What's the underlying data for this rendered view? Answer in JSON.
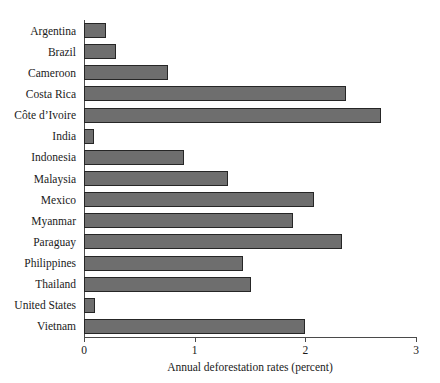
{
  "chart_data": {
    "type": "bar",
    "orientation": "horizontal",
    "title": "",
    "xlabel": "Annual deforestation rates (percent)",
    "ylabel": "",
    "xlim": [
      0,
      3
    ],
    "xticks": [
      "0",
      "1",
      "2",
      "3"
    ],
    "xtick_values": [
      0,
      1,
      2,
      3
    ],
    "grid": false,
    "legend": false,
    "bar_color": "#6e6e6e",
    "bar_border_color": "#262626",
    "axis_color": "#4a4a4a",
    "background": "#ffffff",
    "categories": [
      "Argentina",
      "Brazil",
      "Cameroon",
      "Costa Rica",
      "Côte d’Ivoire",
      "India",
      "Indonesia",
      "Malaysia",
      "Mexico",
      "Myanmar",
      "Paraguay",
      "Philippines",
      "Thailand",
      "United States",
      "Vietnam"
    ],
    "values": [
      0.2,
      0.29,
      0.76,
      2.37,
      2.68,
      0.09,
      0.9,
      1.3,
      2.08,
      1.89,
      2.33,
      1.44,
      1.51,
      0.1,
      2.0
    ]
  }
}
